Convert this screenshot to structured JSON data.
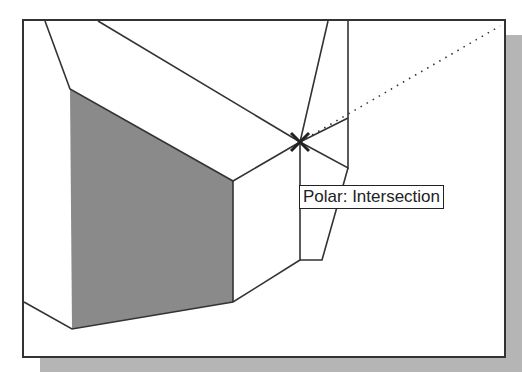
{
  "tooltip": {
    "text": "Polar: Intersection"
  },
  "snap_marker": {
    "type": "intersection",
    "icon": "x-marker-icon"
  },
  "colors": {
    "shaded_face": "#8a8a8a",
    "lines": "#333333",
    "shadow": "#b5b5b5",
    "frame": "#333333"
  }
}
